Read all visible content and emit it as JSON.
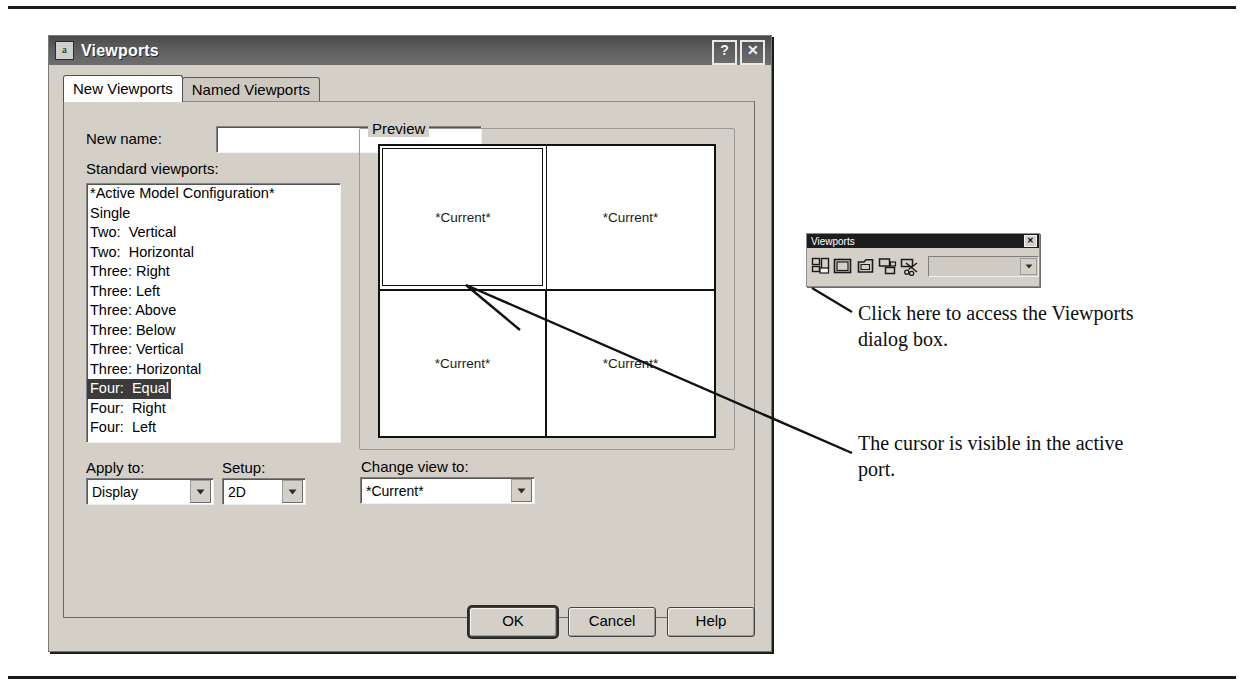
{
  "dialog": {
    "title": "Viewports",
    "icon": "autocad-app-icon",
    "help_button": "?",
    "close_button": "✕",
    "tabs": [
      {
        "label": "New Viewports",
        "active": true
      },
      {
        "label": "Named Viewports",
        "active": false
      }
    ],
    "new_name": {
      "label": "New name:",
      "value": "",
      "placeholder": ""
    },
    "standard_viewports": {
      "label": "Standard viewports:",
      "items": [
        "*Active Model Configuration*",
        "Single",
        "Two:  Vertical",
        "Two:  Horizontal",
        "Three: Right",
        "Three: Left",
        "Three: Above",
        "Three: Below",
        "Three: Vertical",
        "Three: Horizontal",
        "Four:  Equal",
        "Four:  Right",
        "Four:  Left"
      ],
      "selected_index": 10
    },
    "apply_to": {
      "label": "Apply to:",
      "value": "Display"
    },
    "setup": {
      "label": "Setup:",
      "value": "2D"
    },
    "preview": {
      "legend": "Preview",
      "viewports": [
        {
          "label": "*Current*",
          "active": true
        },
        {
          "label": "*Current*",
          "active": false
        },
        {
          "label": "*Current*",
          "active": false
        },
        {
          "label": "*Current*",
          "active": false
        }
      ]
    },
    "change_view_to": {
      "label": "Change view to:",
      "value": "*Current*"
    },
    "buttons": {
      "ok": "OK",
      "cancel": "Cancel",
      "help": "Help"
    }
  },
  "toolbar": {
    "title": "Viewports",
    "close_button": "✕",
    "buttons": [
      {
        "name": "display-viewports-dialog-icon"
      },
      {
        "name": "single-viewport-icon"
      },
      {
        "name": "polygonal-viewport-icon"
      },
      {
        "name": "convert-object-to-viewport-icon"
      },
      {
        "name": "clip-existing-viewport-icon"
      }
    ],
    "scale_combo_value": ""
  },
  "annotations": {
    "click_here": "Click here to access the Viewports dialog box.",
    "cursor": "The cursor is visible in the active port."
  },
  "colors": {
    "dialog_face": "#d4d0c8",
    "titlebar": "#5e5e5e",
    "selection": "#3b3b3b",
    "field": "#ffffff",
    "ink": "#111111"
  }
}
